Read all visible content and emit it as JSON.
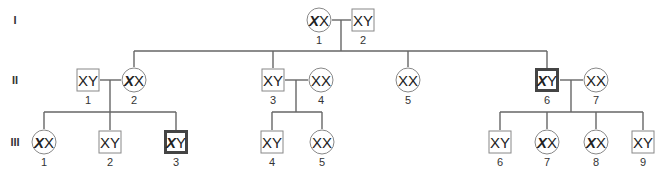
{
  "diagram": {
    "type": "pedigree",
    "line_color": "#666666",
    "affected_border_color": "#444444",
    "generations": [
      {
        "label": "I",
        "y": 20
      },
      {
        "label": "II",
        "y": 80
      },
      {
        "label": "III",
        "y": 142
      }
    ],
    "individuals": [
      {
        "id": "I-1",
        "gen": 0,
        "num": "1",
        "sex": "female",
        "x": 319,
        "genotype": [
          "X",
          "X"
        ],
        "mutant_first": true,
        "affected": false
      },
      {
        "id": "I-2",
        "gen": 0,
        "num": "2",
        "sex": "male",
        "x": 363,
        "genotype": [
          "X",
          "Y"
        ],
        "mutant_first": false,
        "affected": false
      },
      {
        "id": "II-1",
        "gen": 1,
        "num": "1",
        "sex": "male",
        "x": 88,
        "genotype": [
          "X",
          "Y"
        ],
        "mutant_first": false,
        "affected": false
      },
      {
        "id": "II-2",
        "gen": 1,
        "num": "2",
        "sex": "female",
        "x": 134,
        "genotype": [
          "X",
          "X"
        ],
        "mutant_first": true,
        "affected": false
      },
      {
        "id": "II-3",
        "gen": 1,
        "num": "3",
        "sex": "male",
        "x": 273,
        "genotype": [
          "X",
          "Y"
        ],
        "mutant_first": false,
        "affected": false
      },
      {
        "id": "II-4",
        "gen": 1,
        "num": "4",
        "sex": "female",
        "x": 321,
        "genotype": [
          "X",
          "X"
        ],
        "mutant_first": false,
        "affected": false
      },
      {
        "id": "II-5",
        "gen": 1,
        "num": "5",
        "sex": "female",
        "x": 408,
        "genotype": [
          "X",
          "X"
        ],
        "mutant_first": false,
        "affected": false
      },
      {
        "id": "II-6",
        "gen": 1,
        "num": "6",
        "sex": "male",
        "x": 547,
        "genotype": [
          "X",
          "Y"
        ],
        "mutant_first": true,
        "affected": true
      },
      {
        "id": "II-7",
        "gen": 1,
        "num": "7",
        "sex": "female",
        "x": 596,
        "genotype": [
          "X",
          "X"
        ],
        "mutant_first": false,
        "affected": false
      },
      {
        "id": "III-1",
        "gen": 2,
        "num": "1",
        "sex": "female",
        "x": 44,
        "genotype": [
          "X",
          "X"
        ],
        "mutant_first": true,
        "affected": false
      },
      {
        "id": "III-2",
        "gen": 2,
        "num": "2",
        "sex": "male",
        "x": 110,
        "genotype": [
          "X",
          "Y"
        ],
        "mutant_first": false,
        "affected": false
      },
      {
        "id": "III-3",
        "gen": 2,
        "num": "3",
        "sex": "male",
        "x": 176,
        "genotype": [
          "X",
          "Y"
        ],
        "mutant_first": true,
        "affected": true
      },
      {
        "id": "III-4",
        "gen": 2,
        "num": "4",
        "sex": "male",
        "x": 272,
        "genotype": [
          "X",
          "Y"
        ],
        "mutant_first": false,
        "affected": false
      },
      {
        "id": "III-5",
        "gen": 2,
        "num": "5",
        "sex": "female",
        "x": 322,
        "genotype": [
          "X",
          "X"
        ],
        "mutant_first": false,
        "affected": false
      },
      {
        "id": "III-6",
        "gen": 2,
        "num": "6",
        "sex": "male",
        "x": 500,
        "genotype": [
          "X",
          "Y"
        ],
        "mutant_first": false,
        "affected": false
      },
      {
        "id": "III-7",
        "gen": 2,
        "num": "7",
        "sex": "female",
        "x": 547,
        "genotype": [
          "X",
          "X"
        ],
        "mutant_first": true,
        "affected": false
      },
      {
        "id": "III-8",
        "gen": 2,
        "num": "8",
        "sex": "female",
        "x": 596,
        "genotype": [
          "X",
          "X"
        ],
        "mutant_first": true,
        "affected": false
      },
      {
        "id": "III-9",
        "gen": 2,
        "num": "9",
        "sex": "male",
        "x": 643,
        "genotype": [
          "X",
          "Y"
        ],
        "mutant_first": false,
        "affected": false
      }
    ],
    "lines": [
      {
        "x1": 332,
        "y1": 20,
        "x2": 351,
        "y2": 20
      },
      {
        "x1": 341,
        "y1": 20,
        "x2": 341,
        "y2": 51
      },
      {
        "x1": 134,
        "y1": 51,
        "x2": 547,
        "y2": 51
      },
      {
        "x1": 134,
        "y1": 51,
        "x2": 134,
        "y2": 67
      },
      {
        "x1": 273,
        "y1": 51,
        "x2": 273,
        "y2": 68
      },
      {
        "x1": 408,
        "y1": 51,
        "x2": 408,
        "y2": 67
      },
      {
        "x1": 547,
        "y1": 51,
        "x2": 547,
        "y2": 68
      },
      {
        "x1": 100,
        "y1": 80,
        "x2": 121,
        "y2": 80
      },
      {
        "x1": 110,
        "y1": 80,
        "x2": 110,
        "y2": 112
      },
      {
        "x1": 44,
        "y1": 112,
        "x2": 176,
        "y2": 112
      },
      {
        "x1": 44,
        "y1": 112,
        "x2": 44,
        "y2": 129
      },
      {
        "x1": 110,
        "y1": 112,
        "x2": 110,
        "y2": 130
      },
      {
        "x1": 176,
        "y1": 112,
        "x2": 176,
        "y2": 130
      },
      {
        "x1": 285,
        "y1": 80,
        "x2": 308,
        "y2": 80
      },
      {
        "x1": 296,
        "y1": 80,
        "x2": 296,
        "y2": 112
      },
      {
        "x1": 272,
        "y1": 112,
        "x2": 322,
        "y2": 112
      },
      {
        "x1": 272,
        "y1": 112,
        "x2": 272,
        "y2": 130
      },
      {
        "x1": 322,
        "y1": 112,
        "x2": 322,
        "y2": 129
      },
      {
        "x1": 560,
        "y1": 80,
        "x2": 583,
        "y2": 80
      },
      {
        "x1": 571,
        "y1": 80,
        "x2": 571,
        "y2": 112
      },
      {
        "x1": 500,
        "y1": 112,
        "x2": 643,
        "y2": 112
      },
      {
        "x1": 500,
        "y1": 112,
        "x2": 500,
        "y2": 130
      },
      {
        "x1": 547,
        "y1": 112,
        "x2": 547,
        "y2": 129
      },
      {
        "x1": 596,
        "y1": 112,
        "x2": 596,
        "y2": 129
      },
      {
        "x1": 643,
        "y1": 112,
        "x2": 643,
        "y2": 130
      }
    ]
  }
}
